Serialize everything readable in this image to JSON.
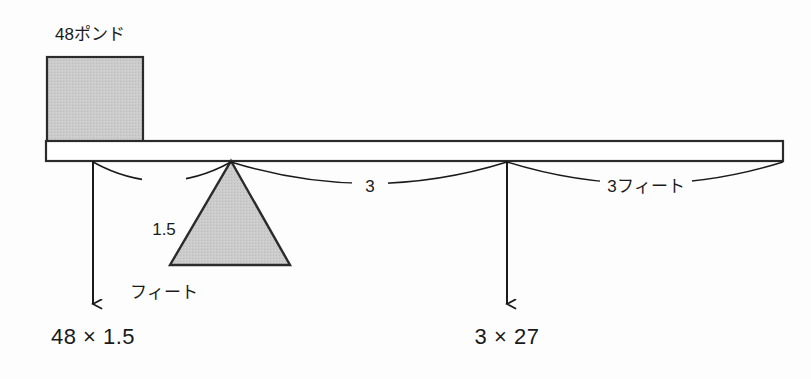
{
  "diagram": {
    "kind": "lever-balance-diagram",
    "background_color": "#fdfdfd",
    "stroke_color": "#1a1a1a",
    "fill_gray": "#c9c9c9",
    "weight": {
      "label": "48ポンド",
      "value": 48,
      "unit": "ポンド"
    },
    "beam": {
      "left_x": 46,
      "right_x": 783,
      "top_y": 141,
      "bottom_y": 161
    },
    "fulcrum": {
      "apex_x": 231,
      "apex_y": 161,
      "base_left_x": 170,
      "base_right_x": 290,
      "base_y": 265
    },
    "dimensions": [
      {
        "name": "left-span",
        "label_line1": "1.5",
        "label_line2": "フィート",
        "value": 1.5,
        "unit": "フィート",
        "from_x": 93,
        "to_x": 231
      },
      {
        "name": "middle-span",
        "label_line1": "3",
        "label_line2": "",
        "value": 3,
        "unit": "",
        "from_x": 231,
        "to_x": 507
      },
      {
        "name": "right-span",
        "label_line1": "3フィート",
        "label_line2": "",
        "value": 3,
        "unit": "フィート",
        "from_x": 507,
        "to_x": 783
      }
    ],
    "forces": [
      {
        "name": "left-force",
        "arrow_x": 93,
        "arrow_top_y": 161,
        "arrow_bottom_y": 312,
        "product_label": "48 × 1.5",
        "factors": [
          48,
          1.5
        ],
        "product_value": 72
      },
      {
        "name": "right-force",
        "arrow_x": 507,
        "arrow_top_y": 161,
        "arrow_bottom_y": 312,
        "product_label": "3 × 27",
        "factors": [
          3,
          27
        ],
        "product_value": 81
      }
    ]
  }
}
